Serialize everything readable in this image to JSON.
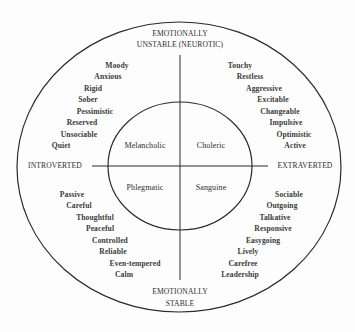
{
  "diagram": {
    "axes": {
      "top": [
        "EMOTIONALLY",
        "UNSTABLE (NEUROTIC)"
      ],
      "bottom": [
        "EMOTIONALLY",
        "STABLE"
      ],
      "left": "INTROVERTED",
      "right": "EXTRAVERTED"
    },
    "temperaments": {
      "top_left": "Melancholic",
      "top_right": "Choleric",
      "bottom_left": "Phlegmatic",
      "bottom_right": "Sanguine"
    },
    "traits": {
      "top_left": [
        "Moody",
        "Anxious",
        "Rigid",
        "Sober",
        "Pessimistic",
        "Reserved",
        "Unsociable",
        "Quiet"
      ],
      "top_right": [
        "Touchy",
        "Restless",
        "Aggressive",
        "Excitable",
        "Changeable",
        "Impulsive",
        "Optimistic",
        "Active"
      ],
      "bottom_left": [
        "Passive",
        "Careful",
        "Thoughtful",
        "Peaceful",
        "Controlled",
        "Reliable",
        "Even-tempered",
        "Calm"
      ],
      "bottom_right": [
        "Sociable",
        "Outgoing",
        "Talkative",
        "Responsive",
        "Easygoing",
        "Lively",
        "Carefree",
        "Leadership"
      ]
    },
    "colors": {
      "line": "#2a2a2a",
      "text": "#333333",
      "background": "#fdfdfd"
    }
  }
}
